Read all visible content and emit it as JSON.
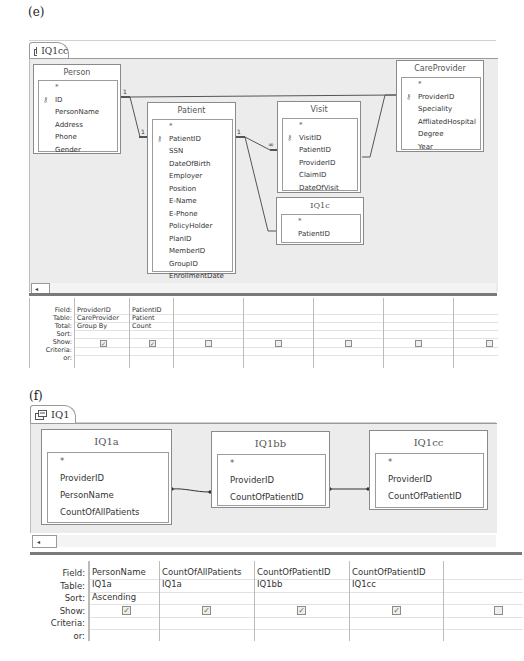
{
  "panel_e": {
    "label": "(e)",
    "tab": {
      "icon": "query-icon",
      "label": "IQ1cc"
    },
    "tables": {
      "person": {
        "title": "Person",
        "fields": [
          "*",
          "ID",
          "PersonName",
          "Address",
          "Phone",
          "Gender"
        ],
        "key": "ID"
      },
      "patient": {
        "title": "Patient",
        "fields": [
          "*",
          "PatientID",
          "SSN",
          "DateOfBirth",
          "Employer",
          "Position",
          "E-Name",
          "E-Phone",
          "PolicyHolder",
          "PlanID",
          "MemberID",
          "GroupID",
          "EnrollmentDate"
        ],
        "key": "PatientID"
      },
      "visit": {
        "title": "Visit",
        "fields": [
          "*",
          "VisitID",
          "PatientID",
          "ProviderID",
          "ClaimID",
          "DateOfVisit"
        ],
        "key": "VisitID"
      },
      "careprovider": {
        "title": "CareProvider",
        "fields": [
          "*",
          "ProviderID",
          "Speciality",
          "AffliatedHospital",
          "Degree",
          "Year"
        ],
        "key": "ProviderID"
      },
      "iq1c": {
        "title": "IQ1c",
        "fields": [
          "*",
          "PatientID"
        ]
      }
    },
    "relationships": [
      {
        "from": "Person.ID",
        "to": "Patient.PatientID",
        "from_card": "1",
        "to_card": "1"
      },
      {
        "from": "Person.ID",
        "to": "CareProvider.ProviderID",
        "from_card": "1"
      },
      {
        "from": "Patient.PatientID",
        "to": "Visit.PatientID",
        "from_card": "1",
        "to_card": "∞"
      },
      {
        "from": "Patient.PatientID",
        "to": "IQ1c.PatientID"
      },
      {
        "from": "Visit.ProviderID",
        "to": "CareProvider.ProviderID"
      }
    ],
    "grid": {
      "row_labels": [
        "Field:",
        "Table:",
        "Total:",
        "Sort:",
        "Show:",
        "Criteria:",
        "or:"
      ],
      "columns": [
        {
          "field": "ProviderID",
          "table": "CareProvider",
          "total": "Group By",
          "sort": "",
          "show": true
        },
        {
          "field": "PatientID",
          "table": "Patient",
          "total": "Count",
          "sort": "",
          "show": true
        },
        {
          "field": "",
          "table": "",
          "total": "",
          "sort": "",
          "show": false
        },
        {
          "field": "",
          "table": "",
          "total": "",
          "sort": "",
          "show": false
        },
        {
          "field": "",
          "table": "",
          "total": "",
          "sort": "",
          "show": false
        },
        {
          "field": "",
          "table": "",
          "total": "",
          "sort": "",
          "show": false
        },
        {
          "field": "",
          "table": "",
          "total": "",
          "sort": "",
          "show": false
        }
      ]
    }
  },
  "panel_f": {
    "label": "(f)",
    "tab": {
      "icon": "query-icon",
      "label": "IQ1"
    },
    "tables": {
      "iq1a": {
        "title": "IQ1a",
        "fields": [
          "*",
          "ProviderID",
          "PersonName",
          "CountOfAllPatients"
        ]
      },
      "iq1bb": {
        "title": "IQ1bb",
        "fields": [
          "*",
          "ProviderID",
          "CountOfPatientID"
        ]
      },
      "iq1cc": {
        "title": "IQ1cc",
        "fields": [
          "*",
          "ProviderID",
          "CountOfPatientID"
        ]
      }
    },
    "relationships": [
      {
        "from": "IQ1a.ProviderID",
        "to": "IQ1bb.ProviderID"
      },
      {
        "from": "IQ1bb.ProviderID",
        "to": "IQ1cc.ProviderID"
      }
    ],
    "grid": {
      "row_labels": [
        "Field:",
        "Table:",
        "Sort:",
        "Show:",
        "Criteria:",
        "or:"
      ],
      "columns": [
        {
          "field": "PersonName",
          "table": "IQ1a",
          "sort": "Ascending",
          "show": true
        },
        {
          "field": "CountOfAllPatients",
          "table": "IQ1a",
          "sort": "",
          "show": true
        },
        {
          "field": "CountOfPatientID",
          "table": "IQ1bb",
          "sort": "",
          "show": true
        },
        {
          "field": "CountOfPatientID",
          "table": "IQ1cc",
          "sort": "",
          "show": true
        },
        {
          "field": "",
          "table": "",
          "sort": "",
          "show": false
        }
      ]
    }
  },
  "icons": {
    "check": "✓",
    "key": "🔑",
    "scroll_left": "◂",
    "star": "*"
  }
}
